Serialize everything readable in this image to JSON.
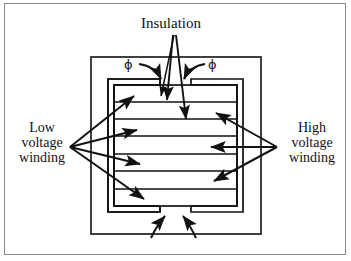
{
  "figure": {
    "type": "transformer-cross-section-diagram",
    "labels": {
      "insulation": "Insulation",
      "low_voltage_winding": "Low\nvoltage\nwinding",
      "high_voltage_winding": "High\nvoltage\nwinding",
      "flux_left": "ϕ",
      "flux_right": "ϕ"
    },
    "colors": {
      "ink": "#111111",
      "frame": "#8a8a8a",
      "background": "#ffffff"
    },
    "annotations": {
      "insulation_arrow_count": 2,
      "low_voltage_arrow_count": 4,
      "high_voltage_arrow_count": 3,
      "flux_arrow_count_top": 2,
      "flux_arrow_count_bottom": 2,
      "winding_layer_count": 7
    }
  }
}
